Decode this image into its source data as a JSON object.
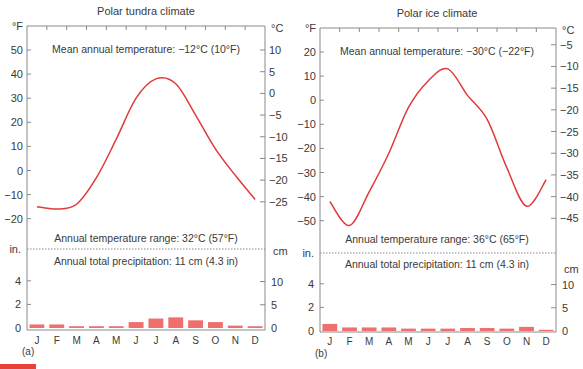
{
  "figure_mark_color": "#e8413b",
  "chart_data": [
    {
      "type": "line",
      "panel_label": "(a)",
      "title": "Polar tundra climate",
      "xlabel": "",
      "categories": [
        "J",
        "F",
        "M",
        "A",
        "M",
        "J",
        "J",
        "A",
        "S",
        "O",
        "N",
        "D"
      ],
      "temperature": {
        "unit_left": "°F",
        "unit_right": "°C",
        "left_ticks": [
          50,
          40,
          30,
          20,
          10,
          0,
          -10,
          -20
        ],
        "right_ticks": [
          10,
          5,
          0,
          -5,
          -10,
          -15,
          -20,
          -25
        ],
        "ylim_f": [
          -28,
          58
        ],
        "series": [
          {
            "name": "Temperature (°F)",
            "values": [
              -15,
              -16,
              -14,
              -3,
              13,
              30,
              38,
              36,
              23,
              9,
              -2,
              -12
            ]
          }
        ],
        "mean_annual_label": "Mean annual temperature: −12°C (10°F)",
        "range_label": "Annual temperature range: 32°C (57°F)"
      },
      "precipitation": {
        "type": "bar",
        "unit_left": "in.",
        "unit_right": "cm",
        "left_ticks": [
          4,
          2,
          0
        ],
        "right_ticks": [
          10,
          5,
          0
        ],
        "series": [
          {
            "name": "Precipitation (in)",
            "values": [
              0.3,
              0.3,
              0.15,
              0.15,
              0.15,
              0.5,
              0.8,
              0.9,
              0.65,
              0.5,
              0.2,
              0.15
            ]
          }
        ],
        "total_label": "Annual total precipitation: 11 cm (4.3 in)"
      }
    },
    {
      "type": "line",
      "panel_label": "(b)",
      "title": "Polar ice climate",
      "xlabel": "",
      "categories": [
        "J",
        "F",
        "M",
        "A",
        "M",
        "J",
        "J",
        "A",
        "S",
        "O",
        "N",
        "D"
      ],
      "temperature": {
        "unit_left": "°F",
        "unit_right": "°C",
        "left_ticks": [
          20,
          10,
          0,
          -10,
          -20,
          -30,
          -40,
          -50
        ],
        "right_ticks": [
          -5,
          -10,
          -15,
          -20,
          -25,
          -30,
          -35,
          -40,
          -45
        ],
        "ylim_f": [
          -58,
          28
        ],
        "series": [
          {
            "name": "Temperature (°F)",
            "values": [
              -42,
              -52,
              -38,
              -22,
              -3,
              8,
              13,
              2,
              -8,
              -28,
              -44,
              -33
            ]
          }
        ],
        "mean_annual_label": "Mean annual temperature: −30°C (−22°F)",
        "range_label": "Annual temperature range: 36°C (65°F)"
      },
      "precipitation": {
        "type": "bar",
        "unit_left": "in.",
        "unit_right": "cm",
        "left_ticks": [
          4,
          2,
          0
        ],
        "right_ticks": [
          10,
          5,
          0
        ],
        "series": [
          {
            "name": "Precipitation (in)",
            "values": [
              0.6,
              0.3,
              0.3,
              0.3,
              0.2,
              0.2,
              0.2,
              0.25,
              0.25,
              0.2,
              0.35,
              0.1
            ]
          }
        ],
        "total_label": "Annual total precipitation: 11 cm (4.3 in)"
      }
    }
  ]
}
